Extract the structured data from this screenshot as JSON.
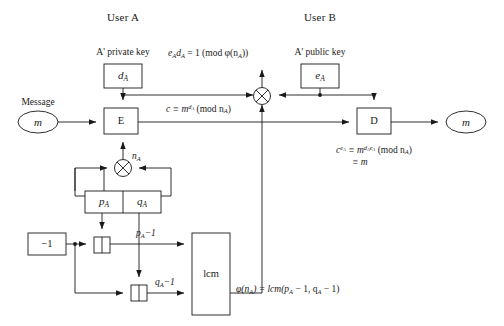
{
  "diagram": {
    "title_note": "RSA digital signature block diagram",
    "headers": {
      "user_a": "User A",
      "user_b": "User B"
    },
    "captions": {
      "private_key": "A' private key",
      "public_key": "A' public key",
      "message": "Message"
    },
    "blocks": {
      "encrypt": "E",
      "decrypt": "D",
      "lcm": "lcm",
      "minus_one": "−1",
      "d_a": "d",
      "d_a_sub": "A",
      "e_a": "e",
      "e_a_sub": "A",
      "p_a": "p",
      "p_a_sub": "A",
      "q_a": "q",
      "q_a_sub": "A",
      "message_m": "m",
      "output_m": "m"
    },
    "signal_labels": {
      "n_a": "n",
      "n_a_sub": "A",
      "p_a_minus_1": "p",
      "p_a_minus_1_sub": "A",
      "p_a_minus_1_tail": "−1",
      "q_a_minus_1": "q",
      "q_a_minus_1_sub": "A",
      "q_a_minus_1_tail": "−1"
    },
    "equations": {
      "key_relation": {
        "lead": "e",
        "lead_sub": "A",
        "mid": "d",
        "mid_sub": "A",
        "tail": " = 1 (mod φ(n",
        "tail_sub": "A",
        "close": "))"
      },
      "ciphertext": {
        "lead": "c ≡ m",
        "exp": "d",
        "exp_sub": "A",
        "tail": " (mod n",
        "tail_sub": "A",
        "close": ")"
      },
      "verification_line1": {
        "lead": "c",
        "lead_exp": "e",
        "lead_exp_sub": "A",
        "mid": " ≡ m",
        "mid_exp": "d",
        "mid_exp_sub": "A",
        "mid_exp2": "e",
        "mid_exp2_sub": "A",
        "tail": " (mod n",
        "tail_sub": "A",
        "close": ")"
      },
      "verification_line2": "≡ m",
      "totient": {
        "lead": "φ(n",
        "lead_sub": "A",
        "mid": ") = lcm(p",
        "mid_sub": "A",
        "mid2": " − 1, q",
        "mid2_sub": "A",
        "tail": " − 1)"
      }
    },
    "icons": {
      "multiply_top": "multiply-circle-icon",
      "multiply_keygen": "multiply-circle-icon",
      "adder_p": "adder-icon",
      "adder_q": "adder-icon"
    },
    "colors": {
      "stroke": "#1a1a1a",
      "background": "#ffffff",
      "text": "#1a1a1a"
    }
  }
}
